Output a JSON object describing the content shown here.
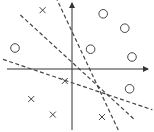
{
  "diagram": {
    "colors": {
      "stroke": "#444444",
      "background": "#ffffff"
    },
    "axes": {
      "x_arrow": true,
      "y_arrow": true
    },
    "classes": [
      {
        "name": "circle",
        "marker": "circle-icon"
      },
      {
        "name": "cross",
        "marker": "cross-icon"
      }
    ],
    "circles": [
      {
        "x": 0.52,
        "y": 0.92
      },
      {
        "x": 0.88,
        "y": 0.68
      },
      {
        "x": -0.95,
        "y": 0.35
      },
      {
        "x": 0.31,
        "y": 0.33
      },
      {
        "x": 1.0,
        "y": 0.2
      },
      {
        "x": 0.96,
        "y": -0.33
      }
    ],
    "crosses": [
      {
        "x": -0.49,
        "y": 0.98
      },
      {
        "x": -0.12,
        "y": -0.2
      },
      {
        "x": -0.68,
        "y": -0.5
      },
      {
        "x": -0.32,
        "y": -0.76
      },
      {
        "x": 0.5,
        "y": -0.8
      }
    ],
    "lines": [
      {
        "name": "line-1",
        "p1": {
          "x": -0.27,
          "y": 1.2
        },
        "p2": {
          "x": 0.81,
          "y": -1.1
        }
      },
      {
        "name": "line-2",
        "p1": {
          "x": -0.86,
          "y": 0.9
        },
        "p2": {
          "x": 1.05,
          "y": -0.85
        }
      },
      {
        "name": "line-3",
        "p1": {
          "x": -1.15,
          "y": 0.16
        },
        "p2": {
          "x": 1.34,
          "y": -0.68
        }
      }
    ]
  }
}
